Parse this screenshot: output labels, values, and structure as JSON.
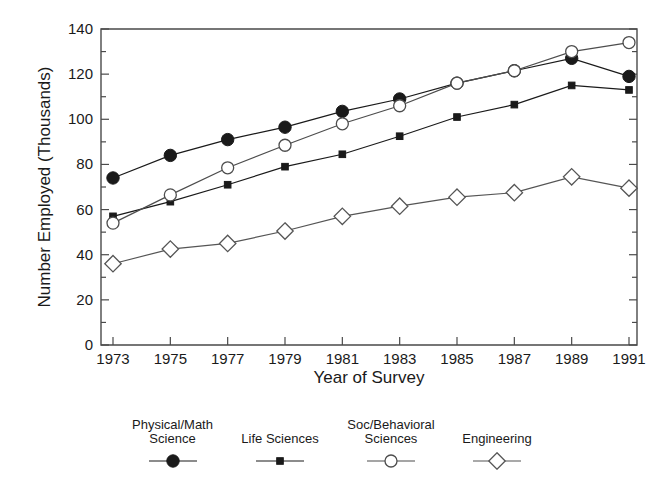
{
  "chart_data": {
    "type": "line",
    "title": "",
    "xlabel": "Year of Survey",
    "ylabel": "Number Employed (Thousands)",
    "x": [
      1973,
      1975,
      1977,
      1979,
      1981,
      1983,
      1985,
      1987,
      1989,
      1991
    ],
    "categories": [
      "1973",
      "1975",
      "1977",
      "1979",
      "1981",
      "1983",
      "1985",
      "1987",
      "1989",
      "1991"
    ],
    "xlim": [
      1972,
      1992
    ],
    "ylim": [
      0,
      140
    ],
    "ytick_labels": [
      "0",
      "20",
      "40",
      "60",
      "80",
      "100",
      "120",
      "140"
    ],
    "yticks": [
      0,
      20,
      40,
      60,
      80,
      100,
      120,
      140
    ],
    "yminor_step": 10,
    "grid": false,
    "legend_position": "below-plot",
    "series": [
      {
        "name": "Physical/Math Science",
        "legend_label": "Physical/Math\nScience",
        "marker": "filled-circle",
        "color": "#1a1a1a",
        "values": [
          74,
          84,
          91,
          96.5,
          103.5,
          109,
          116,
          121.5,
          127,
          119
        ]
      },
      {
        "name": "Life Sciences",
        "legend_label": "Life Sciences",
        "marker": "filled-square",
        "color": "#1a1a1a",
        "values": [
          57,
          63.5,
          71,
          79,
          84.5,
          92.5,
          101,
          106.5,
          115,
          113
        ]
      },
      {
        "name": "Soc/Behavioral Sciences",
        "legend_label": "Soc/Behavioral\nSciences",
        "marker": "open-circle",
        "color": "#4d4d4d",
        "values": [
          54,
          66.5,
          78.5,
          88.5,
          98,
          106,
          116,
          121.5,
          130,
          134
        ]
      },
      {
        "name": "Engineering",
        "legend_label": "Engineering",
        "marker": "open-diamond",
        "color": "#555555",
        "values": [
          36,
          42.5,
          45,
          50.5,
          57,
          61.5,
          65.5,
          67.5,
          74.5,
          69.5
        ]
      }
    ]
  },
  "axes": {
    "frame_color": "#4a4a4a",
    "line_color": "#222222"
  }
}
